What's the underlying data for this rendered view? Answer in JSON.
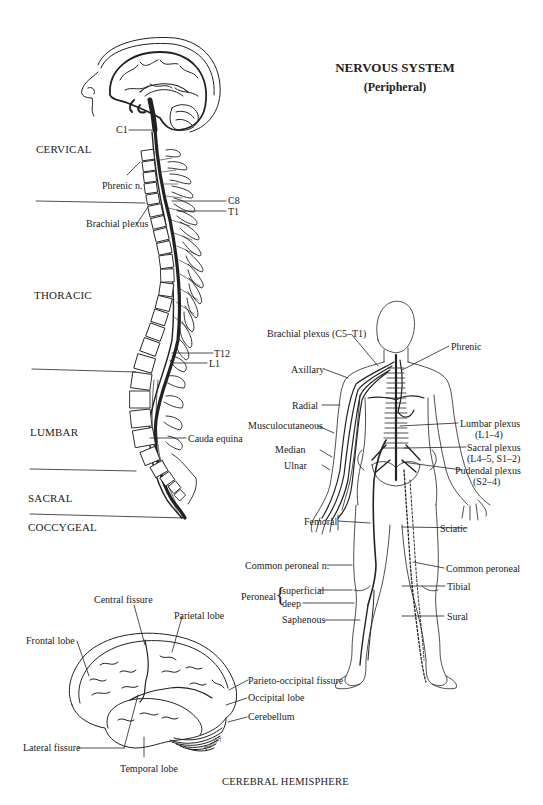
{
  "title": {
    "main": "NERVOUS SYSTEM",
    "sub": "(Peripheral)"
  },
  "spine": {
    "regions": [
      "CERVICAL",
      "THORACIC",
      "LUMBAR",
      "SACRAL",
      "COCCYGEAL"
    ],
    "labels": {
      "c1": "C1",
      "phrenic": "Phrenic n.",
      "c8": "C8",
      "t1": "T1",
      "brachial": "Brachial plexus",
      "t12": "T12",
      "l1": "L1",
      "cauda": "Cauda equina"
    },
    "cervical_numbers": [
      "3",
      "4",
      "5",
      "6",
      "7"
    ],
    "thoracic_numbers": [
      "1",
      "2",
      "3",
      "4",
      "5",
      "6",
      "7",
      "8",
      "9",
      "10",
      "11",
      "12"
    ],
    "lumbar_numbers": [
      "1",
      "2",
      "3",
      "4",
      "5"
    ],
    "sacral_numbers": [
      "1",
      "2",
      "3",
      "4",
      "5"
    ]
  },
  "body": {
    "labels": {
      "brachial": "Brachial plexus (C5–T1)",
      "phrenic": "Phrenic",
      "axillary": "Axillary",
      "radial": "Radial",
      "musculocutaneous": "Musculocutaneous",
      "median": "Median",
      "ulnar": "Ulnar",
      "lumbar_1": "Lumbar plexus",
      "lumbar_2": "(L1–4)",
      "sacral_1": "Sacral plexus",
      "sacral_2": "(L4–5, S1–2)",
      "pudendal_1": "Pudendal plexus",
      "pudendal_2": "(S2–4)",
      "femoral": "Femoral",
      "sciatic": "Sciatic",
      "common_peroneal_n": "Common peroneal n.",
      "common_peroneal": "Common peroneal",
      "peroneal": "Peroneal",
      "superficial": "superficial",
      "deep": "deep",
      "tibial": "Tibial",
      "saphenous": "Saphenous",
      "sural": "Sural"
    }
  },
  "brain": {
    "caption": "CEREBRAL HEMISPHERE",
    "signature": "Pansky",
    "labels": {
      "central": "Central fissure",
      "parietal": "Parietal lobe",
      "frontal": "Frontal lobe",
      "parieto_occipital": "Parieto-occipital fissure",
      "occipital": "Occipital lobe",
      "cerebellum": "Cerebellum",
      "lateral": "Lateral fissure",
      "temporal": "Temporal lobe"
    }
  }
}
